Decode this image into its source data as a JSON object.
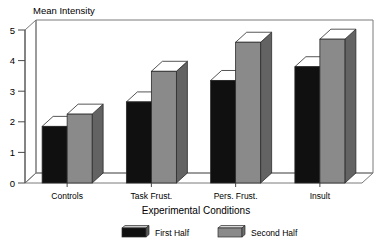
{
  "chart_data": {
    "type": "bar",
    "title": "",
    "ylabel": "Mean Intensity",
    "xlabel": "Experimental Conditions",
    "categories": [
      "Controls",
      "Task Frust.",
      "Pers. Frust.",
      "Insult"
    ],
    "series": [
      {
        "name": "First Half",
        "color": "#101010",
        "values": [
          1.85,
          2.65,
          3.35,
          3.8
        ]
      },
      {
        "name": "Second Half",
        "color": "#8a8a8a",
        "values": [
          2.25,
          3.65,
          4.6,
          4.7
        ]
      }
    ],
    "ylim": [
      0,
      5
    ],
    "yticks": [
      0,
      1,
      2,
      3,
      4,
      5
    ],
    "ytick_labels": [
      "0",
      "1",
      "2",
      "3",
      "4",
      "5"
    ],
    "grid": false,
    "legend_position": "bottom",
    "style": "3d-isometric",
    "legend": [
      {
        "label": "First Half",
        "color": "#101010"
      },
      {
        "label": "Second Half",
        "color": "#8a8a8a"
      }
    ]
  },
  "axis": {
    "y_title": "Mean Intensity",
    "x_title": "Experimental Conditions"
  },
  "ticks": {
    "y": [
      "5",
      "4",
      "3",
      "2",
      "1",
      "0"
    ],
    "x": [
      "Controls",
      "Task Frust.",
      "Pers. Frust.",
      "Insult"
    ]
  },
  "legend": {
    "first_label": "First Half",
    "second_label": "Second Half"
  },
  "colors": {
    "series_first": "#101010",
    "series_second": "#8a8a8a",
    "frame": "#7a7a7a",
    "axis": "#4a4a4a",
    "background": "#ffffff"
  }
}
